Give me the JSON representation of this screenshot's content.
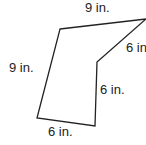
{
  "figure": {
    "shape": "pentagon",
    "side_labels": {
      "top": "9 in.",
      "upper_right": "6 in.",
      "left": "9 in.",
      "inner_right": "6 in.",
      "bottom": "6 in."
    },
    "stroke_color": "#222222"
  }
}
